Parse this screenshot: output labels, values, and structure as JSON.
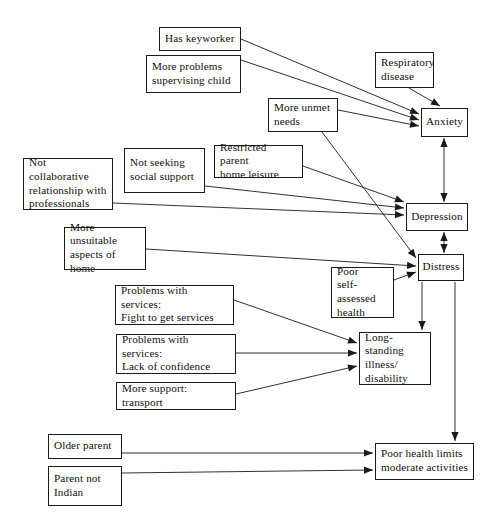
{
  "diagram": {
    "type": "path-diagram",
    "background_color": "#ffffff",
    "line_color": "#1a1a1a",
    "text_color": "#111111",
    "nodes": [
      {
        "id": "has-keyworker",
        "label": "Has keyworker",
        "x": 159,
        "y": 27,
        "w": 82,
        "h": 24,
        "align": "left"
      },
      {
        "id": "more-problems",
        "label": "More problems\nsupervising child",
        "x": 146,
        "y": 55,
        "w": 95,
        "h": 38,
        "align": "left"
      },
      {
        "id": "respiratory-disease",
        "label": "Respiratory\ndisease",
        "x": 375,
        "y": 52,
        "w": 59,
        "h": 36,
        "align": "left"
      },
      {
        "id": "more-unmet-needs",
        "label": "More unmet\nneeds",
        "x": 268,
        "y": 98,
        "w": 70,
        "h": 34,
        "align": "left"
      },
      {
        "id": "anxiety",
        "label": "Anxiety",
        "x": 421,
        "y": 108,
        "w": 47,
        "h": 29,
        "align": "center"
      },
      {
        "id": "not-seeking-support",
        "label": "Not seeking\nsocial support",
        "x": 124,
        "y": 148,
        "w": 81,
        "h": 45,
        "align": "left"
      },
      {
        "id": "restricted-leisure",
        "label": "Restricted parent\nhome leisure",
        "x": 214,
        "y": 145,
        "w": 89,
        "h": 33,
        "align": "left"
      },
      {
        "id": "not-collaborative",
        "label": "Not collaborative\nrelationship with\nprofessionals",
        "x": 23,
        "y": 158,
        "w": 90,
        "h": 52,
        "align": "left"
      },
      {
        "id": "depression",
        "label": "Depression",
        "x": 406,
        "y": 203,
        "w": 62,
        "h": 28,
        "align": "center"
      },
      {
        "id": "more-unsuitable-home",
        "label": "More unsuitable\naspects of home",
        "x": 64,
        "y": 227,
        "w": 82,
        "h": 43,
        "align": "left"
      },
      {
        "id": "distress",
        "label": "Distress",
        "x": 418,
        "y": 254,
        "w": 46,
        "h": 27,
        "align": "center"
      },
      {
        "id": "poor-self-assessed",
        "label": "Poor\nself-assessed\nhealth",
        "x": 331,
        "y": 267,
        "w": 63,
        "h": 51,
        "align": "left"
      },
      {
        "id": "fight-to-get-services",
        "label": "Problems with services:\nFight to get services",
        "x": 115,
        "y": 285,
        "w": 119,
        "h": 40,
        "align": "left"
      },
      {
        "id": "long-standing-illness",
        "label": "Long-standing\nillness/\ndisability",
        "x": 359,
        "y": 332,
        "w": 72,
        "h": 53,
        "align": "left"
      },
      {
        "id": "lack-of-confidence",
        "label": "Problems with services:\nLack of confidence",
        "x": 116,
        "y": 334,
        "w": 120,
        "h": 40,
        "align": "left"
      },
      {
        "id": "more-support-transport",
        "label": "More support: transport",
        "x": 116,
        "y": 382,
        "w": 120,
        "h": 28,
        "align": "left"
      },
      {
        "id": "older-parent",
        "label": "Older parent",
        "x": 48,
        "y": 434,
        "w": 74,
        "h": 25,
        "align": "left"
      },
      {
        "id": "parent-not-indian",
        "label": "Parent not\nIndian",
        "x": 48,
        "y": 466,
        "w": 74,
        "h": 40,
        "align": "left"
      },
      {
        "id": "poor-health-limits",
        "label": "Poor health limits\nmoderate activities",
        "x": 375,
        "y": 443,
        "w": 99,
        "h": 37,
        "align": "left"
      }
    ],
    "edges": [
      {
        "id": "has-keyworker-to-anxiety",
        "from": "has-keyworker",
        "to": "anxiety",
        "x1": 241,
        "y1": 39,
        "x2": 419,
        "y2": 114,
        "heads": "end"
      },
      {
        "id": "more-problems-to-anxiety",
        "from": "more-problems",
        "to": "anxiety",
        "x1": 241,
        "y1": 60,
        "x2": 419,
        "y2": 120,
        "heads": "end"
      },
      {
        "id": "respiratory-to-anxiety",
        "from": "respiratory-disease",
        "to": "anxiety",
        "x1": 409,
        "y1": 88,
        "x2": 440,
        "y2": 106,
        "heads": "end"
      },
      {
        "id": "unmet-needs-to-anxiety",
        "from": "more-unmet-needs",
        "to": "anxiety",
        "x1": 338,
        "y1": 110,
        "x2": 419,
        "y2": 126,
        "heads": "end"
      },
      {
        "id": "unmet-needs-to-distress",
        "from": "more-unmet-needs",
        "to": "distress",
        "x1": 322,
        "y1": 132,
        "x2": 416,
        "y2": 258,
        "heads": "end"
      },
      {
        "id": "not-seeking-to-depression",
        "from": "not-seeking-support",
        "to": "depression",
        "x1": 205,
        "y1": 186,
        "x2": 404,
        "y2": 208,
        "heads": "end"
      },
      {
        "id": "restricted-leisure-to-depression",
        "from": "restricted-leisure",
        "to": "depression",
        "x1": 303,
        "y1": 166,
        "x2": 404,
        "y2": 202,
        "heads": "end"
      },
      {
        "id": "not-collaborative-to-depression",
        "from": "not-collaborative",
        "to": "depression",
        "x1": 113,
        "y1": 203,
        "x2": 404,
        "y2": 215,
        "heads": "end"
      },
      {
        "id": "unsuitable-home-to-distress",
        "from": "more-unsuitable-home",
        "to": "distress",
        "x1": 146,
        "y1": 249,
        "x2": 416,
        "y2": 266,
        "heads": "end"
      },
      {
        "id": "poor-self-assessed-to-distress",
        "from": "poor-self-assessed",
        "to": "distress",
        "x1": 394,
        "y1": 280,
        "x2": 416,
        "y2": 272,
        "heads": "end"
      },
      {
        "id": "anxiety-depression-bidirectional",
        "from": "anxiety",
        "to": "depression",
        "x1": 444,
        "y1": 138,
        "x2": 444,
        "y2": 202,
        "heads": "both"
      },
      {
        "id": "depression-distress-bidirectional",
        "from": "depression",
        "to": "distress",
        "x1": 444,
        "y1": 232,
        "x2": 444,
        "y2": 253,
        "heads": "both"
      },
      {
        "id": "fight-services-to-illness",
        "from": "fight-to-get-services",
        "to": "long-standing-illness",
        "x1": 234,
        "y1": 300,
        "x2": 357,
        "y2": 343,
        "heads": "end"
      },
      {
        "id": "lack-confidence-to-illness",
        "from": "lack-of-confidence",
        "to": "long-standing-illness",
        "x1": 236,
        "y1": 353,
        "x2": 357,
        "y2": 353,
        "heads": "end"
      },
      {
        "id": "transport-to-illness",
        "from": "more-support-transport",
        "to": "long-standing-illness",
        "x1": 236,
        "y1": 394,
        "x2": 357,
        "y2": 366,
        "heads": "end"
      },
      {
        "id": "distress-to-illness",
        "from": "distress",
        "to": "long-standing-illness",
        "x1": 422,
        "y1": 282,
        "x2": 422,
        "y2": 330,
        "heads": "end"
      },
      {
        "id": "distress-to-poor-health",
        "from": "distress",
        "to": "poor-health-limits",
        "x1": 455,
        "y1": 282,
        "x2": 455,
        "y2": 441,
        "heads": "end"
      },
      {
        "id": "older-parent-to-poor-health",
        "from": "older-parent",
        "to": "poor-health-limits",
        "x1": 122,
        "y1": 453,
        "x2": 373,
        "y2": 453,
        "heads": "end"
      },
      {
        "id": "parent-not-indian-to-poor-health",
        "from": "parent-not-indian",
        "to": "poor-health-limits",
        "x1": 122,
        "y1": 473,
        "x2": 373,
        "y2": 470,
        "heads": "end"
      }
    ]
  }
}
